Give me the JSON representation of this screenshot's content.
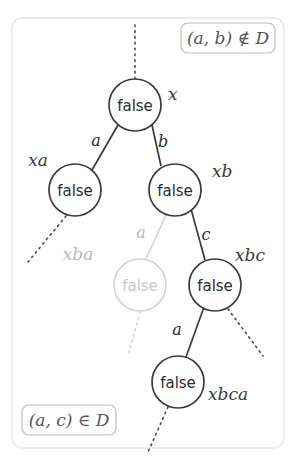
{
  "figure": {
    "frame_color": "#e3e3e3",
    "node_color": "#3a3a3a",
    "ghost_color": "#c9c9c9",
    "annotation_color": "#888888"
  },
  "annotations": [
    {
      "id": "top-right",
      "text": "(a, b) ∉ D",
      "x": 243,
      "y": 40
    },
    {
      "id": "bottom-left",
      "text": "(a, c) ∈ D",
      "x": 70,
      "y": 420
    }
  ],
  "nodes": [
    {
      "id": "root",
      "value": "false",
      "path_label": "x",
      "cx": 135,
      "cy": 105,
      "r": 26,
      "ghost": false,
      "label_x": 168,
      "label_y": 100
    },
    {
      "id": "xa",
      "value": "false",
      "path_label": "xa",
      "cx": 75,
      "cy": 190,
      "r": 26,
      "ghost": false,
      "label_x": 38,
      "label_y": 166
    },
    {
      "id": "xb",
      "value": "false",
      "path_label": "xb",
      "cx": 175,
      "cy": 190,
      "r": 26,
      "ghost": false,
      "label_x": 212,
      "label_y": 177
    },
    {
      "id": "xba",
      "value": "false",
      "path_label": "xba",
      "cx": 140,
      "cy": 285,
      "r": 26,
      "ghost": true,
      "label_x": 78,
      "label_y": 260
    },
    {
      "id": "xbc",
      "value": "false",
      "path_label": "xbc",
      "cx": 215,
      "cy": 285,
      "r": 26,
      "ghost": false,
      "label_x": 250,
      "label_y": 261
    },
    {
      "id": "xbca",
      "value": "false",
      "path_label": "xbca",
      "cx": 178,
      "cy": 382,
      "r": 26,
      "ghost": false,
      "label_x": 208,
      "label_y": 400
    }
  ],
  "edges": [
    {
      "id": "root-xa",
      "from": "root",
      "to": "xa",
      "label": "a",
      "label_x": 96,
      "label_y": 146,
      "ghost": false
    },
    {
      "id": "root-xb",
      "from": "root",
      "to": "xb",
      "label": "b",
      "label_x": 163,
      "label_y": 147,
      "ghost": false
    },
    {
      "id": "xb-xba",
      "from": "xb",
      "to": "xba",
      "label": "a",
      "label_x": 141,
      "label_y": 238,
      "ghost": true
    },
    {
      "id": "xb-xbc",
      "from": "xb",
      "to": "xbc",
      "label": "c",
      "label_x": 206,
      "label_y": 240,
      "ghost": false
    },
    {
      "id": "xbc-xbca",
      "from": "xbc",
      "to": "xbca",
      "label": "a",
      "label_x": 177,
      "label_y": 335,
      "ghost": false
    }
  ],
  "dotted_edges": [
    {
      "id": "above-root",
      "x1": 135,
      "y1": 25,
      "x2": 135,
      "y2": 78,
      "ghost": false
    },
    {
      "id": "below-xa",
      "x1": 66,
      "y1": 216,
      "x2": 28,
      "y2": 262,
      "ghost": false
    },
    {
      "id": "below-xba",
      "x1": 140,
      "y1": 312,
      "x2": 128,
      "y2": 356,
      "ghost": true
    },
    {
      "id": "below-xbc",
      "x1": 228,
      "y1": 309,
      "x2": 263,
      "y2": 356,
      "ghost": false
    },
    {
      "id": "below-xbca",
      "x1": 168,
      "y1": 407,
      "x2": 148,
      "y2": 452,
      "ghost": false
    }
  ]
}
